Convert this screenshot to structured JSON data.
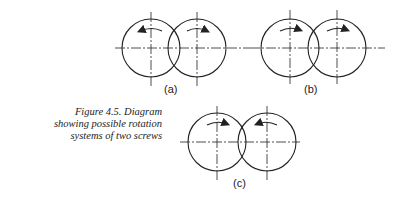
{
  "caption": {
    "lines": [
      "Figure 4.5. Diagram",
      "showing possible rotation",
      "systems of two screws"
    ]
  },
  "diagrams": [
    {
      "label": "(a)",
      "left_rotation": "counterclockwise",
      "right_rotation": "clockwise"
    },
    {
      "label": "(b)",
      "left_rotation": "clockwise",
      "right_rotation": "clockwise"
    },
    {
      "label": "(c)",
      "left_rotation": "clockwise",
      "right_rotation": "counterclockwise"
    }
  ],
  "colors": {
    "line": "#222222",
    "background": "#ffffff"
  }
}
